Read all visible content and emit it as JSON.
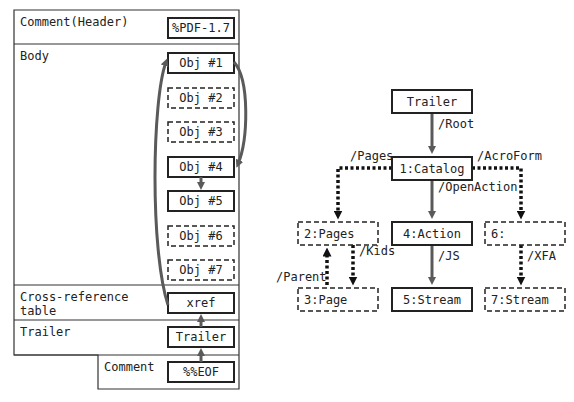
{
  "left_panel": {
    "sections": [
      {
        "label": "Comment(Header)"
      },
      {
        "label": "Body"
      },
      {
        "label_line1": "Cross-reference",
        "label_line2": "table"
      },
      {
        "label": "Trailer"
      },
      {
        "label": "Comment"
      }
    ],
    "boxes": [
      {
        "id": "header",
        "text": "%PDF-1.7",
        "style": "solid"
      },
      {
        "id": "obj1",
        "text": "Obj #1",
        "style": "solid"
      },
      {
        "id": "obj2",
        "text": "Obj #2",
        "style": "dashed"
      },
      {
        "id": "obj3",
        "text": "Obj #3",
        "style": "dashed"
      },
      {
        "id": "obj4",
        "text": "Obj #4",
        "style": "solid"
      },
      {
        "id": "obj5",
        "text": "Obj #5",
        "style": "solid"
      },
      {
        "id": "obj6",
        "text": "Obj #6",
        "style": "dashed"
      },
      {
        "id": "obj7",
        "text": "Obj #7",
        "style": "dashed"
      },
      {
        "id": "xref",
        "text": "xref",
        "style": "solid"
      },
      {
        "id": "trailer",
        "text": "Trailer",
        "style": "solid"
      },
      {
        "id": "eof",
        "text": "%%EOF",
        "style": "solid"
      }
    ]
  },
  "right_panel": {
    "nodes": [
      {
        "id": "trailer",
        "text": "Trailer",
        "style": "solid"
      },
      {
        "id": "catalog",
        "text": "1:Catalog",
        "style": "solid"
      },
      {
        "id": "pages",
        "text": "2:Pages",
        "style": "dashed"
      },
      {
        "id": "action",
        "text": "4:Action",
        "style": "solid"
      },
      {
        "id": "acroform",
        "text": "6:",
        "style": "dashed"
      },
      {
        "id": "page",
        "text": "3:Page",
        "style": "dashed"
      },
      {
        "id": "stream5",
        "text": "5:Stream",
        "style": "solid"
      },
      {
        "id": "stream7",
        "text": "7:Stream",
        "style": "dashed"
      }
    ],
    "edges": [
      {
        "from": "trailer",
        "to": "catalog",
        "label": "/Root",
        "style": "solid"
      },
      {
        "from": "catalog",
        "to": "pages",
        "label": "/Pages",
        "style": "dotted"
      },
      {
        "from": "catalog",
        "to": "acroform",
        "label": "/AcroForm",
        "style": "dotted"
      },
      {
        "from": "catalog",
        "to": "action",
        "label": "/OpenAction",
        "style": "solid"
      },
      {
        "from": "pages",
        "to": "page",
        "label": "/Kids",
        "style": "dotted"
      },
      {
        "from": "page",
        "to": "pages",
        "label": "/Parent",
        "style": "dotted"
      },
      {
        "from": "action",
        "to": "stream5",
        "label": "/JS",
        "style": "solid"
      },
      {
        "from": "acroform",
        "to": "stream7",
        "label": "/XFA",
        "style": "dotted"
      }
    ]
  },
  "colors": {
    "border": "#222222",
    "arrow": "#5a5a5a",
    "dotted": "#111111"
  }
}
